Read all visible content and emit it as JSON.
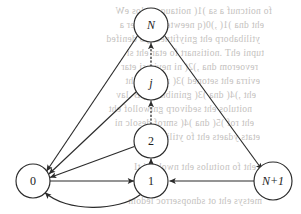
{
  "figure": {
    "type": "state-transition-diagram",
    "width": 301,
    "height": 214,
    "background_color": "#ffffff",
    "ink_color": "#2b2b2b",
    "bleedthrough_color": "#b9b6b3"
  },
  "nodes": [
    {
      "id": "N",
      "label": "N",
      "x": 151,
      "y": 25,
      "r": 17,
      "italic": true
    },
    {
      "id": "j",
      "label": "j",
      "x": 151,
      "y": 83,
      "r": 17,
      "italic": true
    },
    {
      "id": "2",
      "label": "2",
      "x": 151,
      "y": 141,
      "r": 17,
      "italic": false
    },
    {
      "id": "1",
      "label": "1",
      "x": 151,
      "y": 181,
      "r": 17,
      "italic": false
    },
    {
      "id": "0",
      "label": "0",
      "x": 33,
      "y": 181,
      "r": 17,
      "italic": false
    },
    {
      "id": "Np1",
      "label": "N+1",
      "x": 273,
      "y": 181,
      "r": 19,
      "italic": true
    }
  ],
  "edges": [
    {
      "id": "N-to-0",
      "from": "N",
      "to": "0",
      "style": "solid",
      "shape": "straight"
    },
    {
      "id": "j-to-0",
      "from": "j",
      "to": "0",
      "style": "solid",
      "shape": "straight"
    },
    {
      "id": "2-to-0",
      "from": "2",
      "to": "0",
      "style": "solid",
      "shape": "straight"
    },
    {
      "id": "0-to-1",
      "from": "0",
      "to": "1",
      "style": "solid",
      "shape": "straight"
    },
    {
      "id": "1-to-0",
      "from": "1",
      "to": "0",
      "style": "solid",
      "shape": "curved-below"
    },
    {
      "id": "1-to-2",
      "from": "1",
      "to": "2",
      "style": "solid",
      "shape": "straight"
    },
    {
      "id": "2-to-j",
      "from": "2",
      "to": "j",
      "style": "dotted",
      "shape": "straight"
    },
    {
      "id": "j-to-N",
      "from": "j",
      "to": "N",
      "style": "dotted",
      "shape": "straight"
    },
    {
      "id": "N-to-Np1",
      "from": "N",
      "to": "Np1",
      "style": "solid",
      "shape": "straight"
    },
    {
      "id": "Np1-to-1",
      "from": "Np1",
      "to": "1",
      "style": "solid",
      "shape": "straight"
    }
  ],
  "bleedthrough_lines": [
    {
      "text": "fo noitcnuf a sa )1( noitauqe evlos eW",
      "x": 22,
      "y": 6
    },
    {
      "text": "eht dna )1( ,)0(q neewteb noitaler a",
      "x": 14,
      "y": 20
    },
    {
      "text": "ytilibaborp eht gniyfitnedi yb denifed",
      "x": 10,
      "y": 34
    },
    {
      "text": "tupni ehT .noitisnart fo etar eht si",
      "x": 14,
      "y": 48
    },
    {
      "text": "revoerom dna ,)2( ni nevig si etar",
      "x": 8,
      "y": 62
    },
    {
      "text": "evirra eht setoned )3( ni mret eht",
      "x": 10,
      "y": 76
    },
    {
      "text": "eht ,)4( dna )3( gninibmoc yB .lav",
      "x": 6,
      "y": 90
    },
    {
      "text": "noitulos eht sedivorp gniwollof eht",
      "x": 2,
      "y": 104
    },
    {
      "text": "eht rof )5( dna )4( smrof desolc ni",
      "x": 4,
      "y": 118
    },
    {
      "text": "etats ydaets eht fo ytilibaborp",
      "x": 10,
      "y": 132
    },
    {
      "text": "eht fo noitulos eht nwohs si tI",
      "x": 6,
      "y": 162
    },
    {
      "text": "metsys eht ot sdnopserroc ledom",
      "x": 12,
      "y": 196
    }
  ]
}
